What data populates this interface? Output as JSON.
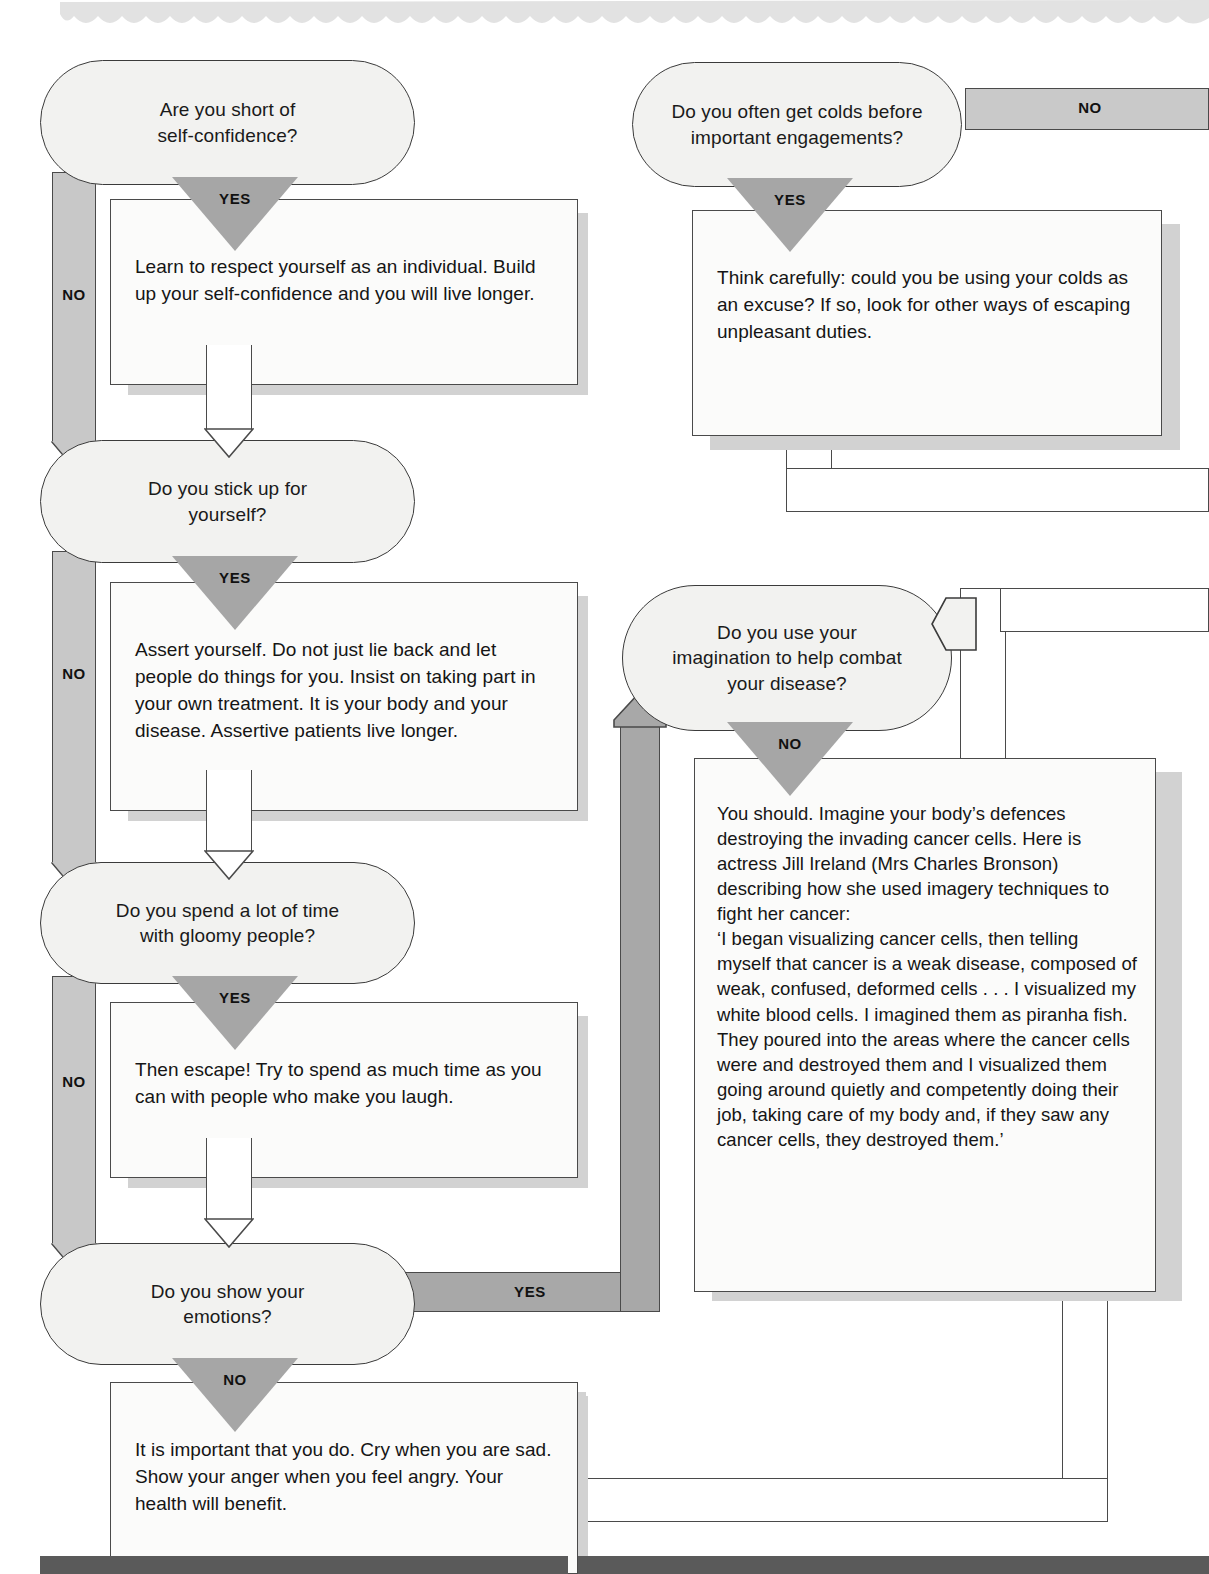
{
  "document": {
    "kind": "decision-flowchart",
    "theme": {
      "node_fill": "#f2f2f0",
      "box_fill": "#fbfbfa",
      "outline": "#3b3b3b",
      "triangle_gray": "#a6a6a6",
      "connector_gray": "#a8a8a8",
      "spine_gray": "#c8c8c8",
      "shadow_gray": "#d2d2d2",
      "text": "#151515"
    }
  },
  "labels": {
    "yes": "YES",
    "no": "NO"
  },
  "left_column": {
    "nodes": [
      {
        "id": "self-confidence",
        "text_lines": [
          "Are you short of",
          "self-confidence?"
        ]
      },
      {
        "id": "stick-up",
        "text_lines": [
          "Do you stick up for",
          "yourself?"
        ]
      },
      {
        "id": "gloomy-people",
        "text_lines": [
          "Do you spend a lot of time",
          "with gloomy people?"
        ]
      },
      {
        "id": "show-emotions",
        "text_lines": [
          "Do you show your",
          "emotions?"
        ]
      }
    ],
    "advice": [
      {
        "id": "advice-respect",
        "text": "Learn to respect yourself as an individual. Build up your self-confidence and you will live longer."
      },
      {
        "id": "advice-assert",
        "text": "Assert yourself. Do not just lie back and let people do things for you. Insist on taking part in your own treatment. It is your body and your disease. Assertive patients live longer."
      },
      {
        "id": "advice-escape",
        "text": "Then escape! Try to spend as much time as you can with people who make you laugh."
      },
      {
        "id": "advice-emotions",
        "text": "It is important that you do. Cry when you are sad. Show your anger when you feel angry. Your health will benefit."
      }
    ]
  },
  "right_column": {
    "nodes": [
      {
        "id": "colds",
        "text_lines": [
          "Do you often get colds before",
          "important engagements?"
        ]
      },
      {
        "id": "imagination",
        "text_lines": [
          "Do you use your",
          "imagination to help combat",
          "your disease?"
        ]
      }
    ],
    "advice": [
      {
        "id": "advice-colds",
        "text": "Think carefully: could you be using your colds as an excuse? If so, look for other ways of escaping unpleasant duties."
      },
      {
        "id": "advice-imagination",
        "text": "You should. Imagine your body’s defences destroying the invading cancer cells. Here is actress Jill Ireland (Mrs Charles Bronson) describing how she used imagery techniques to fight her cancer:\n‘I began visualizing cancer cells, then telling myself that cancer is a weak disease, composed of weak, confused, deformed cells . . . I visualized my white blood cells. I imagined them as piranha fish. They poured into the areas where the cancer cells were and destroyed them and I visualized them going around quietly and competently doing their job, taking care of my body and, if they saw any cancer cells, they destroyed them.’"
      }
    ]
  },
  "branch_labels": {
    "self_confidence_yes": "YES",
    "self_confidence_no": "NO",
    "stick_up_yes": "YES",
    "stick_up_no": "NO",
    "gloomy_yes": "YES",
    "gloomy_no": "NO",
    "emotions_no": "NO",
    "emotions_yes": "YES",
    "colds_yes": "YES",
    "colds_no": "NO",
    "imagination_no": "NO"
  }
}
